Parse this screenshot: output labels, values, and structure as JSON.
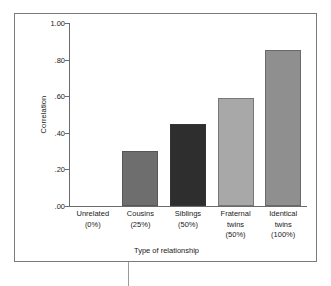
{
  "chart_data": {
    "type": "bar",
    "title": "",
    "xlabel": "Type of relationship",
    "ylabel": "Correlation",
    "categories": [
      "Unrelated\n(0%)",
      "Cousins\n(25%)",
      "Siblings\n(50%)",
      "Fraternal\ntwins\n(50%)",
      "Identical\ntwins\n(100%)"
    ],
    "values": [
      0.0,
      0.3,
      0.45,
      0.59,
      0.85
    ],
    "bar_colors": [
      "#ffffff",
      "#6e6e6e",
      "#2e2e2e",
      "#a8a8a8",
      "#8f8f8f"
    ],
    "ylim": [
      0.0,
      1.0
    ],
    "yticks": [
      "1.00",
      ".80",
      ".60",
      ".40",
      ".20",
      ".00"
    ],
    "ytick_values": [
      1.0,
      0.8,
      0.6,
      0.4,
      0.2,
      0.0
    ],
    "grid": false,
    "legend": false
  },
  "figure": {
    "border_color": "#7a7a7a",
    "axis_color": "#6b6b6b",
    "background": "#ffffff",
    "text_color": "#1a1a1a"
  }
}
